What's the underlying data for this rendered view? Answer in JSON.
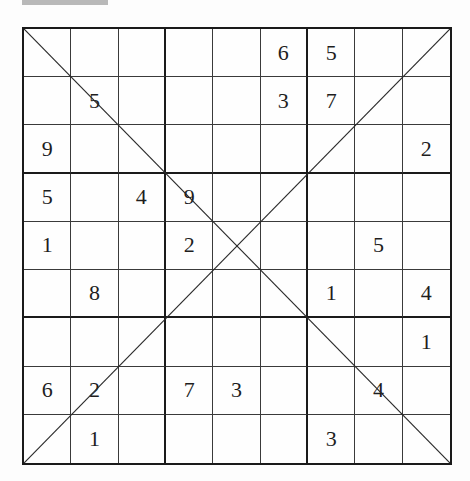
{
  "puzzle": {
    "type": "diagonal-sudoku",
    "size": 9,
    "box_size": 3,
    "diagonals": [
      "main",
      "anti"
    ],
    "grid": [
      [
        "",
        "",
        "",
        "",
        "",
        "6",
        "5",
        "",
        ""
      ],
      [
        "",
        "5",
        "",
        "",
        "",
        "3",
        "7",
        "",
        ""
      ],
      [
        "9",
        "",
        "",
        "",
        "",
        "",
        "",
        "",
        "2"
      ],
      [
        "5",
        "",
        "4",
        "9",
        "",
        "",
        "",
        "",
        ""
      ],
      [
        "1",
        "",
        "",
        "2",
        "",
        "",
        "",
        "5",
        ""
      ],
      [
        "",
        "8",
        "",
        "",
        "",
        "",
        "1",
        "",
        "4"
      ],
      [
        "",
        "",
        "",
        "",
        "",
        "",
        "",
        "",
        "1"
      ],
      [
        "6",
        "2",
        "",
        "7",
        "3",
        "",
        "",
        "4",
        ""
      ],
      [
        "",
        "1",
        "",
        "",
        "",
        "",
        "3",
        "",
        ""
      ]
    ]
  },
  "colors": {
    "line": "#1a1a1a",
    "thin_line": "#3a3a3a",
    "digit": "#1e1e1e",
    "background": "#fdfdfd",
    "top_bar": "#b9b9b9"
  }
}
